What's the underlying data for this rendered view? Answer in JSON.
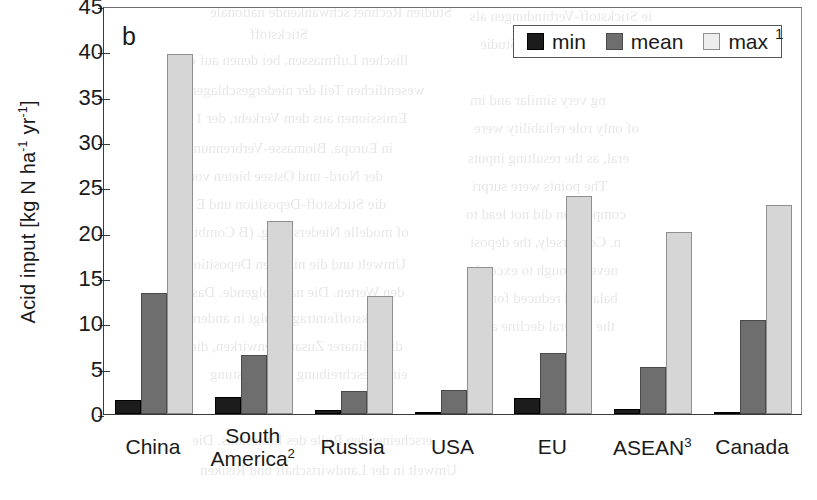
{
  "panel_label": "b",
  "legend": {
    "items": [
      {
        "label": "min",
        "color": "#1c1c1c"
      },
      {
        "label": "mean",
        "color": "#6e6e6e"
      },
      {
        "label": "max",
        "color": "#ededed"
      }
    ],
    "footnote": "1"
  },
  "axis": {
    "y_title_main": "Acid input [kg N ha",
    "y_title_sup1": "-1",
    "y_title_mid": " yr",
    "y_title_sup2": "-1",
    "y_title_end": "]"
  },
  "chart_data": {
    "type": "bar",
    "title": "b",
    "xlabel": "",
    "ylabel": "Acid input [kg N ha-1 yr-1]",
    "ylim": [
      0,
      45
    ],
    "ytick_values": [
      0,
      5,
      10,
      15,
      20,
      25,
      30,
      35,
      40,
      45
    ],
    "ytick_labels": [
      "0",
      "5",
      "10",
      "15",
      "20",
      "25",
      "30",
      "35",
      "40",
      "45"
    ],
    "grid": false,
    "legend_position": "top-right",
    "categories": [
      "China",
      "South America",
      "Russia",
      "USA",
      "EU",
      "ASEAN",
      "Canada"
    ],
    "category_labels": [
      "China",
      "South America2",
      "Russia",
      "USA",
      "EU",
      "ASEAN3",
      "Canada"
    ],
    "category_footnotes": [
      "",
      "2",
      "",
      "",
      "",
      "3",
      ""
    ],
    "series": [
      {
        "name": "min",
        "color": "#1c1c1c",
        "values": [
          1.6,
          1.9,
          0.4,
          0.1,
          1.8,
          0.5,
          0.1
        ]
      },
      {
        "name": "mean",
        "color": "#6e6e6e",
        "values": [
          13.3,
          6.5,
          2.5,
          2.6,
          6.7,
          5.2,
          10.4
        ]
      },
      {
        "name": "max",
        "color": "#d6d6d6",
        "values": [
          39.7,
          21.3,
          13.0,
          16.2,
          24.0,
          20.1,
          23.0
        ]
      }
    ]
  }
}
